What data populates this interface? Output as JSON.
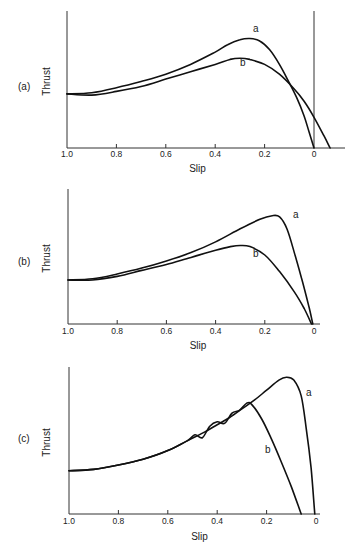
{
  "figure": {
    "panels": [
      {
        "id": "a",
        "label": "(a)",
        "ylabel": "Thrust",
        "xlabel": "Slip"
      },
      {
        "id": "b",
        "label": "(b)",
        "ylabel": "Thrust",
        "xlabel": "Slip"
      },
      {
        "id": "c",
        "label": "(c)",
        "ylabel": "Thrust",
        "xlabel": "Slip"
      }
    ]
  },
  "chart_data": [
    {
      "type": "line",
      "panel_label": "(a)",
      "title": "",
      "xlabel": "Slip",
      "ylabel": "Thrust",
      "x_ticks": [
        "1.0",
        "0.8",
        "0.6",
        "0.4",
        "0.2",
        "0"
      ],
      "x_reversed": true,
      "xlim": [
        1.0,
        -0.08
      ],
      "ylim": [
        0,
        1
      ],
      "y_ticks": [],
      "grid": false,
      "vertical_reference_line_at_slip": 0,
      "series": [
        {
          "name": "a",
          "x": [
            1.0,
            0.9,
            0.8,
            0.7,
            0.6,
            0.5,
            0.4,
            0.35,
            0.3,
            0.26,
            0.22,
            0.18,
            0.14,
            0.1,
            0.07,
            0.04,
            0.02,
            0.0
          ],
          "y": [
            0.44,
            0.45,
            0.49,
            0.54,
            0.6,
            0.68,
            0.78,
            0.84,
            0.88,
            0.89,
            0.87,
            0.8,
            0.68,
            0.53,
            0.41,
            0.26,
            0.13,
            0.0
          ]
        },
        {
          "name": "b",
          "x": [
            1.0,
            0.9,
            0.8,
            0.7,
            0.6,
            0.5,
            0.4,
            0.34,
            0.3,
            0.26,
            0.2,
            0.14,
            0.08,
            0.04,
            0.0,
            -0.04,
            -0.065
          ],
          "y": [
            0.44,
            0.43,
            0.46,
            0.5,
            0.56,
            0.62,
            0.68,
            0.72,
            0.73,
            0.72,
            0.68,
            0.6,
            0.48,
            0.38,
            0.25,
            0.1,
            0.0
          ]
        }
      ]
    },
    {
      "type": "line",
      "panel_label": "(b)",
      "title": "",
      "xlabel": "Slip",
      "ylabel": "Thrust",
      "x_ticks": [
        "1.0",
        "0.8",
        "0.6",
        "0.4",
        "0.2",
        "0"
      ],
      "x_reversed": true,
      "xlim": [
        1.0,
        -0.05
      ],
      "ylim": [
        0,
        1
      ],
      "y_ticks": [],
      "grid": false,
      "series": [
        {
          "name": "a",
          "x": [
            1.0,
            0.9,
            0.8,
            0.7,
            0.6,
            0.5,
            0.4,
            0.3,
            0.22,
            0.17,
            0.14,
            0.11,
            0.08,
            0.05,
            0.02,
            0.005
          ],
          "y": [
            0.37,
            0.38,
            0.42,
            0.47,
            0.53,
            0.6,
            0.69,
            0.8,
            0.88,
            0.91,
            0.9,
            0.8,
            0.6,
            0.38,
            0.14,
            0.0
          ]
        },
        {
          "name": "b",
          "x": [
            1.0,
            0.9,
            0.8,
            0.7,
            0.6,
            0.5,
            0.4,
            0.34,
            0.3,
            0.26,
            0.2,
            0.14,
            0.08,
            0.04,
            0.01
          ],
          "y": [
            0.37,
            0.37,
            0.4,
            0.45,
            0.5,
            0.56,
            0.62,
            0.65,
            0.66,
            0.65,
            0.58,
            0.44,
            0.27,
            0.13,
            0.0
          ]
        }
      ]
    },
    {
      "type": "line",
      "panel_label": "(c)",
      "title": "",
      "xlabel": "Slip",
      "ylabel": "Thrust",
      "x_ticks": [
        "1.0",
        "0.8",
        "0.6",
        "0.4",
        "0.2",
        "0"
      ],
      "x_reversed": true,
      "xlim": [
        1.0,
        -0.02
      ],
      "ylim": [
        0,
        1
      ],
      "y_ticks": [],
      "grid": false,
      "annotation": "curve b oscillates about curve a between slip ≈0.52 and ≈0.28",
      "series": [
        {
          "name": "a",
          "x": [
            1.0,
            0.9,
            0.8,
            0.7,
            0.6,
            0.52,
            0.45,
            0.4,
            0.35,
            0.3,
            0.25,
            0.2,
            0.15,
            0.12,
            0.09,
            0.06,
            0.04,
            0.02,
            0.005
          ],
          "y": [
            0.3,
            0.31,
            0.34,
            0.38,
            0.44,
            0.51,
            0.57,
            0.62,
            0.67,
            0.73,
            0.79,
            0.86,
            0.93,
            0.95,
            0.93,
            0.82,
            0.6,
            0.32,
            0.0
          ]
        },
        {
          "name": "b",
          "x": [
            1.0,
            0.9,
            0.8,
            0.7,
            0.6,
            0.52,
            0.49,
            0.46,
            0.43,
            0.4,
            0.37,
            0.34,
            0.31,
            0.28,
            0.26,
            0.22,
            0.18,
            0.14,
            0.1,
            0.06
          ],
          "y": [
            0.3,
            0.31,
            0.34,
            0.38,
            0.44,
            0.51,
            0.55,
            0.53,
            0.61,
            0.64,
            0.63,
            0.7,
            0.72,
            0.77,
            0.76,
            0.66,
            0.52,
            0.36,
            0.19,
            0.0
          ]
        }
      ]
    }
  ]
}
